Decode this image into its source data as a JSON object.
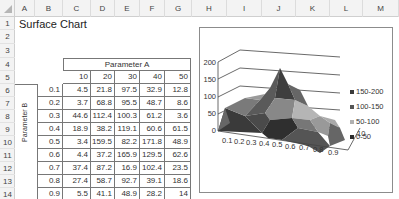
{
  "spreadsheet": {
    "columns": [
      "A",
      "B",
      "C",
      "D",
      "E",
      "F",
      "G",
      "H",
      "I",
      "J",
      "K",
      "L",
      "M"
    ],
    "rows": [
      "1",
      "2",
      "3",
      "4",
      "5",
      "6",
      "7",
      "8",
      "9",
      "10",
      "11",
      "12",
      "13",
      "14"
    ],
    "title": "Surface Chart"
  },
  "table": {
    "param_a_label": "Parameter A",
    "param_b_label": "Parameter B",
    "col_headers": [
      "10",
      "20",
      "30",
      "40",
      "50"
    ],
    "row_headers": [
      "0.1",
      "0.2",
      "0.3",
      "0.4",
      "0.5",
      "0.6",
      "0.7",
      "0.8",
      "0.9"
    ],
    "values": [
      [
        "4.5",
        "21.8",
        "97.5",
        "32.9",
        "12.8"
      ],
      [
        "3.7",
        "68.8",
        "95.5",
        "48.7",
        "8.6"
      ],
      [
        "44.6",
        "112.4",
        "100.3",
        "61.2",
        "3.6"
      ],
      [
        "18.9",
        "38.2",
        "119.1",
        "60.6",
        "61.5"
      ],
      [
        "3.4",
        "159.5",
        "82.2",
        "171.8",
        "48.9"
      ],
      [
        "4.4",
        "37.2",
        "165.9",
        "129.5",
        "62.6"
      ],
      [
        "37.4",
        "87.2",
        "16.9",
        "102.4",
        "23.5"
      ],
      [
        "27.4",
        "58.7",
        "92.7",
        "39.1",
        "18.6"
      ],
      [
        "5.5",
        "41.1",
        "48.9",
        "28.2",
        "14"
      ]
    ]
  },
  "chart_data": {
    "type": "surface",
    "title": "",
    "x": [
      "0.1",
      "0.2",
      "0.3",
      "0.4",
      "0.5",
      "0.6",
      "0.7",
      "0.8",
      "0.9"
    ],
    "series_axis": [
      "10",
      "20",
      "30",
      "40",
      "50"
    ],
    "series": [
      {
        "name": "10",
        "values": [
          4.5,
          3.7,
          44.6,
          18.9,
          3.4,
          4.4,
          37.4,
          27.4,
          5.5
        ]
      },
      {
        "name": "20",
        "values": [
          21.8,
          68.8,
          112.4,
          38.2,
          159.5,
          37.2,
          87.2,
          58.7,
          41.1
        ]
      },
      {
        "name": "30",
        "values": [
          97.5,
          95.5,
          100.3,
          119.1,
          82.2,
          165.9,
          16.9,
          92.7,
          48.9
        ]
      },
      {
        "name": "40",
        "values": [
          32.9,
          48.7,
          61.2,
          60.6,
          171.8,
          129.5,
          102.4,
          39.1,
          28.2
        ]
      },
      {
        "name": "50",
        "values": [
          12.8,
          8.6,
          3.6,
          61.5,
          48.9,
          62.6,
          23.5,
          18.6,
          14
        ]
      }
    ],
    "y_ticks": [
      "0",
      "50",
      "100",
      "150",
      "200"
    ],
    "x_ticks": [
      "0.1",
      "0.2",
      "0.3",
      "0.4",
      "0.5",
      "0.6",
      "0.7",
      "0.8",
      "0.9"
    ],
    "depth_tick": "10",
    "ylim": [
      0,
      200
    ],
    "legend": [
      {
        "label": "150-200",
        "color": "#3a3a3a"
      },
      {
        "label": "100-150",
        "color": "#555555"
      },
      {
        "label": "50-100",
        "color": "#b0b0b0"
      },
      {
        "label": "0-50",
        "color": "#2a2a2a"
      }
    ],
    "legend_position": "right",
    "grid": true
  }
}
